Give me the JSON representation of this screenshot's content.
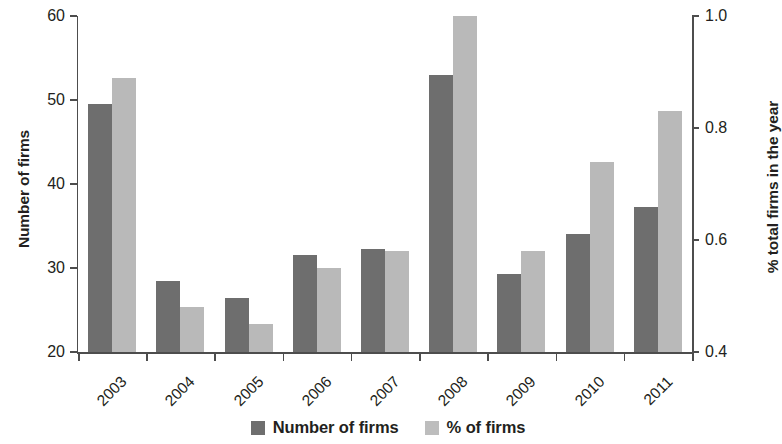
{
  "chart_data": {
    "type": "bar",
    "title": "",
    "subtitle": "",
    "xlabel": "",
    "ylabel": "Number of firms",
    "y2label": "% total firms in the year",
    "categories": [
      "2003",
      "2004",
      "2005",
      "2006",
      "2007",
      "2008",
      "2009",
      "2010",
      "2011"
    ],
    "series": [
      {
        "name": "Number of firms",
        "axis": "left",
        "color": "#6e6e6e",
        "values": [
          49.5,
          28.5,
          26.4,
          31.5,
          32.3,
          53.0,
          29.3,
          34.1,
          37.3
        ]
      },
      {
        "name": "% of firms",
        "axis": "right",
        "color": "#b9b9b9",
        "values": [
          0.89,
          0.48,
          0.45,
          0.55,
          0.58,
          1.0,
          0.58,
          0.74,
          0.83
        ]
      }
    ],
    "ylim": [
      20,
      60
    ],
    "yticks": [
      20,
      30,
      40,
      50,
      60
    ],
    "yticklabels": [
      "20",
      "30",
      "40",
      "50",
      "60"
    ],
    "y2lim": [
      0.4,
      1.0
    ],
    "y2ticks": [
      0.4,
      0.6,
      0.8,
      1.0
    ],
    "y2ticklabels": [
      "0.4",
      "0.6",
      "0.8",
      "1.0"
    ],
    "grid": false,
    "legend_position": "bottom-center",
    "legend": [
      "Number of firms",
      "% of firms"
    ]
  },
  "legend": {
    "entries": [
      {
        "label": "Number of firms",
        "color": "#6e6e6e"
      },
      {
        "label": "% of firms",
        "color": "#bdbdbd"
      }
    ]
  }
}
